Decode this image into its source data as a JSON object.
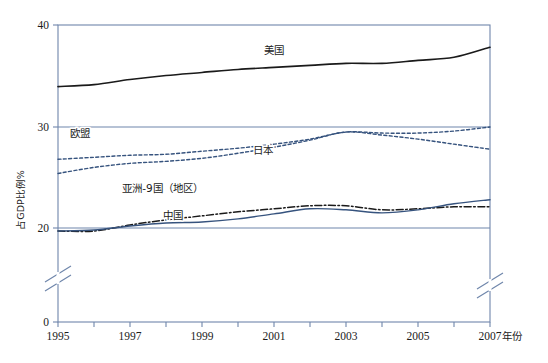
{
  "chart_data": {
    "type": "line",
    "title": "",
    "xlabel": "年份",
    "ylabel": "占GDP比例%",
    "grid": true,
    "legend_position": "inline-labels",
    "x": [
      1995,
      1996,
      1997,
      1998,
      1999,
      2000,
      2001,
      2002,
      2003,
      2004,
      2005,
      2006,
      2007
    ],
    "xlim": [
      1995,
      2007
    ],
    "ylim": [
      0,
      40
    ],
    "y_ticks": [
      0,
      20,
      30,
      40
    ],
    "x_ticks": [
      1995,
      1996,
      1997,
      1998,
      1999,
      2000,
      2001,
      2002,
      2003,
      2004,
      2005,
      2006,
      2007
    ],
    "x_tick_labels": [
      "1995",
      "",
      "1997",
      "",
      "1999",
      "",
      "2001",
      "",
      "2003",
      "",
      "2005",
      "",
      "2007"
    ],
    "y_axis_break": true,
    "y_axis_break_range": [
      2,
      18
    ],
    "series": [
      {
        "name": "美国",
        "style": "solid",
        "color": "#1a1a1a",
        "width": 1.6,
        "label_x": 2001.0,
        "label_y": 37.2,
        "values": [
          34.0,
          34.2,
          34.7,
          35.1,
          35.4,
          35.7,
          35.9,
          36.1,
          36.3,
          36.3,
          36.6,
          36.9,
          37.9
        ]
      },
      {
        "name": "欧盟",
        "style": "dashed",
        "color": "#36537e",
        "width": 1.4,
        "label_x": 1995.6,
        "label_y": 29.0,
        "values": [
          26.8,
          27.0,
          27.2,
          27.3,
          27.6,
          27.9,
          28.3,
          28.8,
          29.5,
          29.4,
          29.4,
          29.6,
          30.0
        ]
      },
      {
        "name": "日本",
        "style": "dashed",
        "color": "#36537e",
        "width": 1.4,
        "label_x": 2000.7,
        "label_y": 27.3,
        "values": [
          25.4,
          26.0,
          26.4,
          26.6,
          26.9,
          27.4,
          28.0,
          28.7,
          29.5,
          29.2,
          28.8,
          28.3,
          27.8
        ]
      },
      {
        "name": "亚洲-9国（地区）",
        "style": "dashdot",
        "color": "#1a1a1a",
        "width": 1.5,
        "label_x": 1997.9,
        "label_y": 23.6,
        "values": [
          19.7,
          19.7,
          20.3,
          20.8,
          21.2,
          21.6,
          21.9,
          22.2,
          22.2,
          21.8,
          21.9,
          22.1,
          22.1
        ]
      },
      {
        "name": "中国",
        "style": "solid",
        "color": "#36537e",
        "width": 1.4,
        "label_x": 1998.2,
        "label_y": 20.9,
        "values": [
          19.7,
          19.8,
          20.2,
          20.5,
          20.6,
          20.9,
          21.4,
          21.9,
          21.8,
          21.5,
          21.8,
          22.4,
          22.8
        ]
      }
    ],
    "colors": {
      "frame": "#6f86ab",
      "gridline": "#6f86ab",
      "accent_blue": "#36537e",
      "accent_black": "#1a1a1a",
      "background": "#ffffff"
    }
  }
}
